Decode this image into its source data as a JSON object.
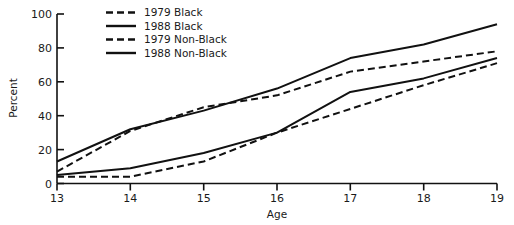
{
  "chart_data": {
    "type": "line",
    "title": "",
    "xlabel": "Age",
    "ylabel": "Percent",
    "xlim": [
      13,
      19
    ],
    "ylim": [
      0,
      100
    ],
    "grid": false,
    "legend_position": "top-center",
    "x": [
      13,
      14,
      15,
      16,
      17,
      18,
      19
    ],
    "xticks": [
      "13",
      "14",
      "15",
      "16",
      "17",
      "18",
      "19"
    ],
    "yticks": [
      "0",
      "20",
      "40",
      "60",
      "80",
      "100"
    ],
    "series": [
      {
        "name": "1979 Black",
        "style": "dashed",
        "color": "#111111",
        "values": [
          4,
          4,
          13,
          30,
          44,
          58,
          71
        ]
      },
      {
        "name": "1988 Black",
        "style": "solid",
        "color": "#111111",
        "values": [
          5,
          9,
          18,
          30,
          54,
          62,
          74
        ]
      },
      {
        "name": "1979 Non-Black",
        "style": "dashed",
        "color": "#111111",
        "values": [
          7,
          31,
          45,
          52,
          66,
          72,
          78
        ]
      },
      {
        "name": "1988 Non-Black",
        "style": "solid",
        "color": "#111111",
        "values": [
          13,
          32,
          43,
          56,
          74,
          82,
          94
        ]
      }
    ]
  },
  "legend": {
    "items": [
      {
        "label": "1979 Black",
        "style": "dashed"
      },
      {
        "label": "1988 Black",
        "style": "solid"
      },
      {
        "label": "1979 Non-Black",
        "style": "dashed"
      },
      {
        "label": "1988 Non-Black",
        "style": "solid"
      }
    ]
  },
  "axes": {
    "y_title": "Percent",
    "x_title": "Age",
    "y_tick_0": "0",
    "y_tick_1": "20",
    "y_tick_2": "40",
    "y_tick_3": "60",
    "y_tick_4": "80",
    "y_tick_5": "100",
    "x_tick_0": "13",
    "x_tick_1": "14",
    "x_tick_2": "15",
    "x_tick_3": "16",
    "x_tick_4": "17",
    "x_tick_5": "18",
    "x_tick_6": "19"
  }
}
